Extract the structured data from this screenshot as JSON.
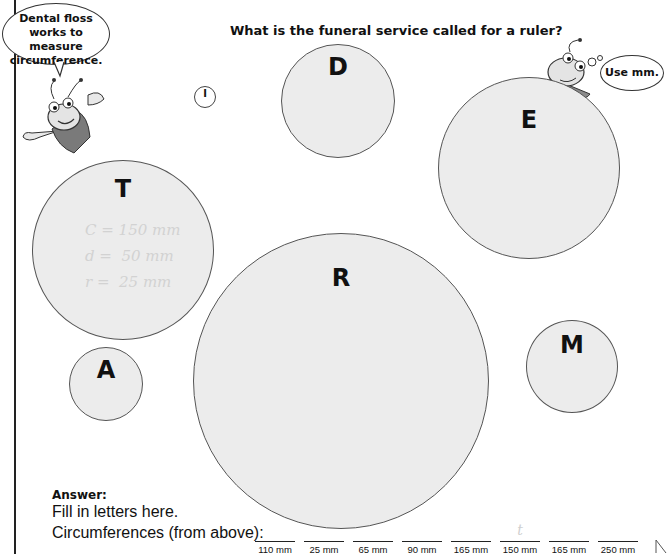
{
  "question": "What is the funeral service called for a ruler?",
  "speech_bubbles": {
    "left": "Dental floss works to measure circumference.",
    "right": "Use mm."
  },
  "small_marker": "I",
  "circles": [
    {
      "letter": "T",
      "notes": [
        "C = 150 mm",
        "d =  50 mm",
        "r =  25 mm"
      ]
    },
    {
      "letter": "D"
    },
    {
      "letter": "E"
    },
    {
      "letter": "R"
    },
    {
      "letter": "A"
    },
    {
      "letter": "M"
    }
  ],
  "answer": {
    "label": "Answer:",
    "instruction": "Fill in letters here.",
    "circumference_label": "Circumferences (from above):",
    "blanks": [
      {
        "mm": "110 mm",
        "written": ""
      },
      {
        "mm": "25 mm",
        "written": ""
      },
      {
        "mm": "65 mm",
        "written": ""
      },
      {
        "mm": "90 mm",
        "written": ""
      },
      {
        "mm": "165 mm",
        "written": ""
      },
      {
        "mm": "150 mm",
        "written": "t"
      },
      {
        "mm": "165 mm",
        "written": ""
      },
      {
        "mm": "250 mm",
        "written": ""
      }
    ]
  }
}
